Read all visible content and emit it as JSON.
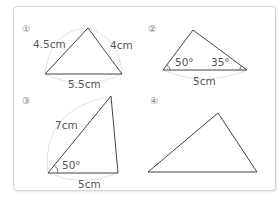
{
  "problems": [
    {
      "number": "①",
      "sides": {
        "left": "4.5cm",
        "right": "4cm",
        "bottom": "5.5cm"
      }
    },
    {
      "number": "②",
      "angles": {
        "left": "50°",
        "right": "35°"
      },
      "sides": {
        "bottom": "5cm"
      }
    },
    {
      "number": "③",
      "sides": {
        "left": "7cm",
        "bottom": "5cm"
      },
      "angles": {
        "left": "50°"
      }
    },
    {
      "number": "④"
    }
  ]
}
